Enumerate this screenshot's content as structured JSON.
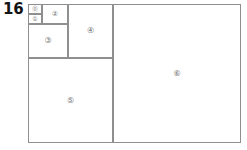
{
  "figure": {
    "number_label": "16",
    "caption": "",
    "type": "squared-rectangle-fibonacci-dissection"
  },
  "style": {
    "stroke_color": "#8f8f8f",
    "label_color": "#6e6e6e",
    "number_color": "#141414",
    "background_color": "#ffffff",
    "stroke_width_px": 1
  },
  "diagram": {
    "outer_rectangle": {
      "name": "outer-rectangle",
      "x": 28,
      "y": 4,
      "width": 213,
      "height": 139
    },
    "squares": [
      {
        "id": "square-0",
        "label": "⓪",
        "label_text": "0",
        "x": 28,
        "y": 4,
        "width": 14,
        "height": 10,
        "label_size": "lbl-tiny"
      },
      {
        "id": "square-1",
        "label": "①",
        "label_text": "1",
        "x": 28,
        "y": 14,
        "width": 14,
        "height": 10,
        "label_size": "lbl-tiny"
      },
      {
        "id": "square-2",
        "label": "②",
        "label_text": "2",
        "x": 42,
        "y": 4,
        "width": 26,
        "height": 20,
        "label_size": "lbl-small"
      },
      {
        "id": "square-3",
        "label": "③",
        "label_text": "3",
        "x": 28,
        "y": 24,
        "width": 40,
        "height": 34,
        "label_size": "lbl-normal"
      },
      {
        "id": "square-4",
        "label": "④",
        "label_text": "4",
        "x": 68,
        "y": 4,
        "width": 45,
        "height": 54,
        "label_size": "lbl-normal"
      },
      {
        "id": "square-5",
        "label": "⑤",
        "label_text": "5",
        "x": 28,
        "y": 58,
        "width": 85,
        "height": 85,
        "label_size": "lbl-normal"
      },
      {
        "id": "square-6",
        "label": "⑥",
        "label_text": "6",
        "x": 113,
        "y": 4,
        "width": 128,
        "height": 139,
        "label_size": "lbl-normal"
      }
    ]
  }
}
